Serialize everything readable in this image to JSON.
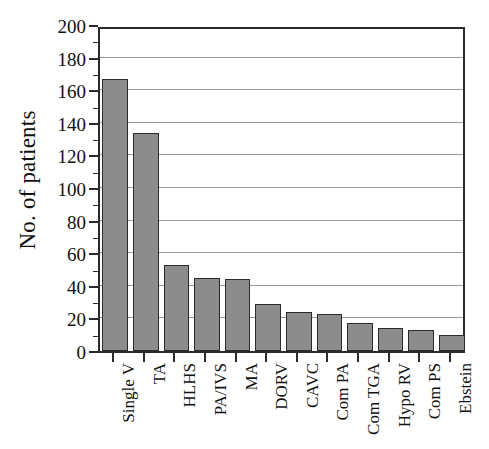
{
  "chart_data": {
    "type": "bar",
    "title": "",
    "xlabel": "",
    "ylabel": "No. of patients",
    "ylim": [
      0,
      200
    ],
    "ytick_step": 20,
    "yminor_step": 10,
    "grid": true,
    "legend": "none",
    "bar_color": "#8c8c8c",
    "bar_edge_color": "#2b2b2b",
    "axis_color": "#2a2a2a",
    "gridline_color": "#9a9a9a",
    "categories": [
      "Single V",
      "TA",
      "HLHS",
      "PA/IVS",
      "MA",
      "DORV",
      "CAVC",
      "Com PA",
      "Com TGA",
      "Hypo RV",
      "Com PS",
      "Ebstein"
    ],
    "values": [
      167,
      134,
      53,
      45,
      44,
      29,
      24,
      23,
      17,
      14,
      13,
      10
    ],
    "ytick_labels": [
      "0",
      "20",
      "40",
      "60",
      "80",
      "100",
      "120",
      "140",
      "160",
      "180",
      "200"
    ],
    "ytick_values": [
      0,
      20,
      40,
      60,
      80,
      100,
      120,
      140,
      160,
      180,
      200
    ]
  }
}
